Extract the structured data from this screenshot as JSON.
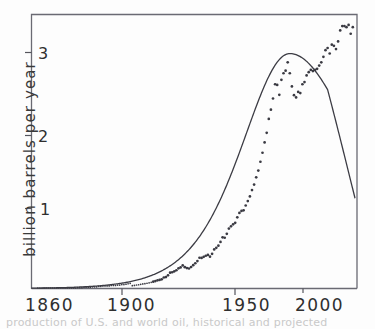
{
  "chart_data": {
    "type": "scatter",
    "title": "",
    "subtitle": "",
    "xlabel": "",
    "ylabel": "billion barrels per year",
    "xlim": [
      1857,
      2012
    ],
    "ylim": [
      0,
      3.45
    ],
    "grid": false,
    "legend": null,
    "x_ticks": [
      1860,
      1900,
      1950,
      2000
    ],
    "x_tick_labels": [
      "1860",
      "1900",
      "1950",
      "2000"
    ],
    "y_ticks": [
      1,
      2,
      3
    ],
    "y_tick_labels": [
      "1",
      "2",
      "3"
    ],
    "series": [
      {
        "name": "annual production data",
        "type": "scatter",
        "marker": "circle",
        "color": "#3a3a42",
        "points": [
          [
            1860,
            0.0
          ],
          [
            1861,
            0.0
          ],
          [
            1862,
            0.0
          ],
          [
            1863,
            0.0
          ],
          [
            1864,
            0.0
          ],
          [
            1865,
            0.0
          ],
          [
            1866,
            0.0
          ],
          [
            1867,
            0.0
          ],
          [
            1868,
            0.0
          ],
          [
            1869,
            0.0
          ],
          [
            1870,
            0.01
          ],
          [
            1871,
            0.01
          ],
          [
            1872,
            0.01
          ],
          [
            1873,
            0.01
          ],
          [
            1874,
            0.01
          ],
          [
            1875,
            0.01
          ],
          [
            1876,
            0.01
          ],
          [
            1877,
            0.01
          ],
          [
            1878,
            0.01
          ],
          [
            1879,
            0.02
          ],
          [
            1880,
            0.02
          ],
          [
            1881,
            0.02
          ],
          [
            1882,
            0.03
          ],
          [
            1883,
            0.03
          ],
          [
            1884,
            0.03
          ],
          [
            1885,
            0.03
          ],
          [
            1886,
            0.04
          ],
          [
            1887,
            0.04
          ],
          [
            1888,
            0.04
          ],
          [
            1889,
            0.05
          ],
          [
            1890,
            0.05
          ],
          [
            1891,
            0.06
          ],
          [
            1892,
            0.06
          ],
          [
            1893,
            0.06
          ],
          [
            1894,
            0.06
          ],
          [
            1895,
            0.07
          ],
          [
            1896,
            0.07
          ],
          [
            1897,
            0.07
          ],
          [
            1898,
            0.08
          ],
          [
            1899,
            0.08
          ],
          [
            1900,
            0.09
          ],
          [
            1901,
            0.09
          ],
          [
            1902,
            0.1
          ],
          [
            1903,
            0.11
          ],
          [
            1904,
            0.12
          ],
          [
            1905,
            0.13
          ],
          [
            1906,
            0.14
          ],
          [
            1907,
            0.16
          ],
          [
            1908,
            0.17
          ],
          [
            1909,
            0.19
          ],
          [
            1910,
            0.21
          ],
          [
            1911,
            0.22
          ],
          [
            1912,
            0.24
          ],
          [
            1913,
            0.26
          ],
          [
            1914,
            0.28
          ],
          [
            1915,
            0.31
          ],
          [
            1916,
            0.34
          ],
          [
            1917,
            0.37
          ],
          [
            1918,
            0.39
          ],
          [
            1919,
            0.42
          ],
          [
            1920,
            0.5
          ],
          [
            1921,
            0.52
          ],
          [
            1922,
            0.6
          ],
          [
            1923,
            0.72
          ],
          [
            1924,
            0.74
          ],
          [
            1925,
            0.78
          ],
          [
            1926,
            0.83
          ],
          [
            1927,
            0.92
          ],
          [
            1928,
            0.96
          ],
          [
            1929,
            1.05
          ],
          [
            1930,
            0.97
          ],
          [
            1931,
            0.93
          ],
          [
            1932,
            0.91
          ],
          [
            1933,
            0.98
          ],
          [
            1934,
            1.06
          ],
          [
            1935,
            1.15
          ],
          [
            1936,
            1.25
          ],
          [
            1937,
            1.4
          ],
          [
            1938,
            1.39
          ],
          [
            1939,
            1.44
          ],
          [
            1940,
            1.49
          ],
          [
            1941,
            1.53
          ],
          [
            1942,
            1.45
          ],
          [
            1943,
            1.58
          ],
          [
            1944,
            1.78
          ],
          [
            1945,
            1.85
          ],
          [
            1946,
            1.95
          ],
          [
            1947,
            2.12
          ],
          [
            1948,
            2.33
          ],
          [
            1949,
            2.31
          ],
          [
            1950,
            2.49
          ],
          [
            1951,
            2.73
          ],
          [
            1952,
            2.83
          ],
          [
            1953,
            2.92
          ],
          [
            1954,
            2.99
          ],
          [
            1955,
            3.24
          ],
          [
            1956,
            3.44
          ],
          [
            1957,
            3.53
          ],
          [
            1958,
            3.56
          ],
          [
            1959,
            3.78
          ],
          [
            1960,
            3.98
          ],
          [
            1961,
            4.19
          ],
          [
            1962,
            4.48
          ],
          [
            1963,
            4.73
          ],
          [
            1964,
            5.06
          ],
          [
            1965,
            5.37
          ],
          [
            1966,
            5.77
          ],
          [
            1967,
            6.18
          ],
          [
            1968,
            6.65
          ],
          [
            1969,
            7.09
          ],
          [
            1970,
            7.72
          ],
          [
            1971,
            8.14
          ],
          [
            1972,
            8.65
          ],
          [
            1973,
            9.3
          ],
          [
            1974,
            9.27
          ],
          [
            1975,
            8.82
          ],
          [
            1976,
            9.5
          ],
          [
            1977,
            9.8
          ],
          [
            1978,
            9.92
          ],
          [
            1979,
            10.3
          ],
          [
            1980,
            9.8
          ],
          [
            1981,
            9.2
          ],
          [
            1982,
            8.8
          ],
          [
            1983,
            8.7
          ],
          [
            1984,
            8.95
          ],
          [
            1985,
            8.9
          ],
          [
            1986,
            9.3
          ],
          [
            1987,
            9.4
          ],
          [
            1988,
            9.7
          ],
          [
            1989,
            9.85
          ],
          [
            1990,
            9.95
          ],
          [
            1991,
            9.9
          ],
          [
            1992,
            9.95
          ],
          [
            1993,
            10.0
          ],
          [
            1994,
            10.15
          ],
          [
            1995,
            10.3
          ],
          [
            1996,
            10.55
          ],
          [
            1997,
            10.85
          ],
          [
            1998,
            10.95
          ],
          [
            1999,
            10.7
          ],
          [
            2000,
            11.1
          ],
          [
            2001,
            11.05
          ],
          [
            2002,
            10.9
          ],
          [
            2003,
            11.25
          ],
          [
            2004,
            11.75
          ],
          [
            2005,
            11.95
          ],
          [
            2006,
            11.95
          ],
          [
            2007,
            11.9
          ],
          [
            2008,
            12.0
          ],
          [
            2009,
            11.6
          ],
          [
            2010,
            11.9
          ]
        ],
        "note": "y values plotted in billion barrels per year; scaled to axis as shown"
      },
      {
        "name": "Hubbert logistic fit curve",
        "type": "line",
        "color": "#3c3c44",
        "peak_year": 1980,
        "peak_value": 3.0,
        "value_at_1860": 0.0,
        "value_at_1900": 0.04,
        "value_at_1920": 0.35,
        "value_at_1930": 0.78,
        "value_at_1940": 1.12,
        "value_at_1950": 1.6,
        "value_at_1960": 2.1,
        "value_at_1970": 2.65,
        "value_at_1990": 2.85,
        "value_at_2000": 2.5,
        "value_at_2010": 2.0
      }
    ]
  },
  "axis": {
    "y_axis_label": "billion barrels per year",
    "y_tick_3": "3",
    "y_tick_2": "2",
    "y_tick_1": "1",
    "x_tick_1860": "1860",
    "x_tick_1900": "1900",
    "x_tick_1950": "1950",
    "x_tick_2000": "2000"
  },
  "caption": {
    "text": "production of U.S. and world oil, historical and projected"
  }
}
